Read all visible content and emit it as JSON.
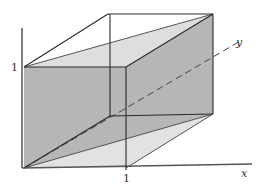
{
  "diagram": {
    "type": "3d-unit-cube-with-plane",
    "labels": {
      "z_tick": "1",
      "x_tick": "1",
      "x_axis": "x",
      "y_axis": "y"
    },
    "colors": {
      "background": "#ffffff",
      "line": "#2a2a2a",
      "dark_plane": "#b4b4b4",
      "light_region": "#dedede",
      "dashed_axis": "#444444"
    }
  }
}
